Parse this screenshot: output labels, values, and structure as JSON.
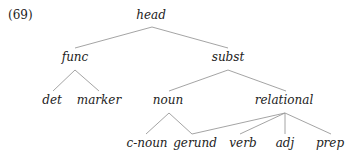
{
  "example_number": "(69)",
  "nodes": {
    "head": {
      "label": "head",
      "x": 151,
      "y": 15
    },
    "func": {
      "label": "func",
      "x": 75,
      "y": 57
    },
    "subst": {
      "label": "subst",
      "x": 228,
      "y": 57
    },
    "det": {
      "label": "det",
      "x": 52,
      "y": 100
    },
    "marker": {
      "label": "marker",
      "x": 99,
      "y": 100
    },
    "noun": {
      "label": "noun",
      "x": 168,
      "y": 100
    },
    "relational": {
      "label": "relational",
      "x": 284,
      "y": 100
    },
    "c_noun": {
      "label": "c-noun",
      "x": 147,
      "y": 143
    },
    "gerund": {
      "label": "gerund",
      "x": 195,
      "y": 143
    },
    "verb": {
      "label": "verb",
      "x": 243,
      "y": 143
    },
    "adj": {
      "label": "adj",
      "x": 285,
      "y": 143
    },
    "prep": {
      "label": "prep",
      "x": 330,
      "y": 143
    }
  },
  "edges": [
    {
      "from": "head",
      "to": "func"
    },
    {
      "from": "head",
      "to": "subst"
    },
    {
      "from": "func",
      "to": "det"
    },
    {
      "from": "func",
      "to": "marker"
    },
    {
      "from": "subst",
      "to": "noun"
    },
    {
      "from": "subst",
      "to": "relational"
    },
    {
      "from": "noun",
      "to": "c-noun"
    },
    {
      "from": "noun",
      "to": "gerund"
    },
    {
      "from": "relational",
      "to": "gerund"
    },
    {
      "from": "relational",
      "to": "verb"
    },
    {
      "from": "relational",
      "to": "adj"
    },
    {
      "from": "relational",
      "to": "prep"
    }
  ]
}
